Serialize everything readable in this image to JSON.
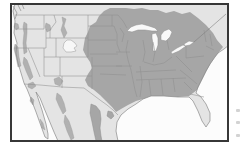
{
  "map": {
    "name": "species-range-map",
    "region_shown": "Continental United States with southern Canada and northern Mexico",
    "style": "grayscale field-guide distribution map, no text labels",
    "shaded_regions": [
      "central and eastern United States from the Great Plains to the Atlantic coast",
      "southern Canada north of the Great Lakes and St. Lawrence",
      "eastern and central Texas",
      "Sierra Madre Oriental strip in northeastern Mexico",
      "patchy strips: Cascades, Pacific coast ranges, Sierra Nevada, southern California",
      "patchy strips: northern Rockies (Idaho/Montana), southeastern Arizona, Sierra Madre Occidental, Baja California"
    ],
    "unshaded_regions": [
      "Florida peninsula",
      "Great Basin and desert Southwest",
      "far-west Texas and south Texas along the Rio Grande",
      "Great Plains fringe with small white enclave near the Black Hills",
      "northern Maine and maritime Canada"
    ],
    "water_features": [
      "Pacific Ocean",
      "Gulf of California",
      "Gulf of Mexico",
      "Atlantic Ocean",
      "Great Lakes",
      "St. Lawrence River"
    ]
  },
  "colors": {
    "page": "#ffffff",
    "frame": "#373737",
    "water": "#fcfcfc",
    "land": "#e4e4e4",
    "range": "#a6a6a6",
    "patch": "#b1b1b1",
    "hole": "#f7f7f7",
    "lake": "#f9f9f9",
    "stateline": "#8f8f8f",
    "coast": "#8a8a8a",
    "river": "#808080",
    "edgemark": "#c9c9c9"
  },
  "artifacts": {
    "edge_marks_count": 3,
    "edge_marks_note": "faint cropped marks along right margin outside map frame"
  }
}
